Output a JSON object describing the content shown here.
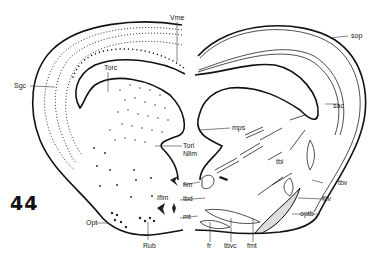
{
  "figure": {
    "section_number": "44",
    "labels": {
      "vme": "Vme",
      "sgc": "Sgc",
      "torc": "Torc",
      "torl": "Torl",
      "nllm": "Nllm",
      "mps": "mps",
      "sop": "sop",
      "sac": "sac",
      "tbi": "tbi",
      "tbv": "tbv",
      "fltv": "fltv",
      "optb": "optb",
      "flm": "flm",
      "tbd": "tbd",
      "iflm": "Iflm",
      "mt": "mt",
      "opt": "Opt",
      "rub": "Rub",
      "fr": "fr",
      "tbvc": "tbvc",
      "fmt": "fmt"
    }
  }
}
